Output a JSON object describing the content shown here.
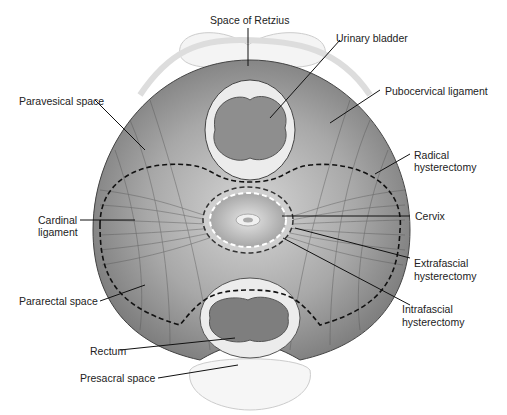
{
  "diagram": {
    "type": "anatomical cross-section of female pelvis",
    "labels": {
      "space_of_retzius": "Space of Retzius",
      "urinary_bladder": "Urinary bladder",
      "pubocervical_ligament": "Pubocervical ligament",
      "paravesical_space": "Paravesical space",
      "radical_hysterectomy_1": "Radical",
      "radical_hysterectomy_2": "hysterectomy",
      "cardinal_ligament_1": "Cardinal",
      "cardinal_ligament_2": "ligament",
      "cervix": "Cervix",
      "extrafascial_1": "Extrafascial",
      "extrafascial_2": "hysterectomy",
      "pararectal_space": "Pararectal space",
      "intrafascial_1": "Intrafascial",
      "intrafascial_2": "hysterectomy",
      "rectum": "Rectum",
      "presacral_space": "Presacral space"
    },
    "colors": {
      "tissue_dark": "#7a7a7a",
      "tissue_light": "#c8c8c8",
      "organ_fill": "#8c8c8c",
      "organ_ring": "#e8e8e8",
      "outline": "#333333"
    }
  }
}
